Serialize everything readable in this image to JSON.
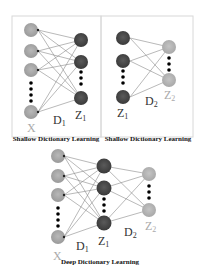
{
  "diagram": {
    "panels": [
      {
        "id": "shallow-1",
        "caption": "Shallow Dictionary Learning",
        "input_label": "X",
        "dict_label": "D",
        "dict_sub": "1",
        "output_label": "Z",
        "output_sub": "1"
      },
      {
        "id": "shallow-2",
        "caption": "Shallow Dictionary Learning",
        "input_label": "Z",
        "input_sub": "1",
        "dict_label": "D",
        "dict_sub": "2",
        "output_label": "Z",
        "output_sub": "2"
      },
      {
        "id": "deep",
        "caption": "Deep Dictionary Learning",
        "input_label": "X",
        "dict1_label": "D",
        "dict1_sub": "1",
        "hidden_label": "Z",
        "hidden_sub": "1",
        "dict2_label": "D",
        "dict2_sub": "2",
        "output_label": "Z",
        "output_sub": "2"
      }
    ],
    "colors": {
      "input_node": "#a3a3a3",
      "hidden_node": "#4a4a4a",
      "output_node": "#b5b5b5",
      "edge": "#8a8a8a",
      "ellipsis_dot": "#000000"
    }
  }
}
